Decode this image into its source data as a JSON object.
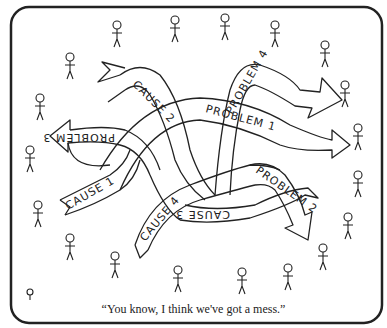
{
  "cartoon": {
    "caption": "“You know, I think we've got a mess.”",
    "arrows": [
      {
        "label": "CAUSE 2",
        "direction": "up-left"
      },
      {
        "label": "PROBLEM 4",
        "direction": "right"
      },
      {
        "label": "PROBLEM 1",
        "direction": "right"
      },
      {
        "label": "PROBLEM 3",
        "direction": "left"
      },
      {
        "label": "CAUSE 1",
        "direction": "left-tail"
      },
      {
        "label": "CAUSE 4",
        "direction": "down-tail"
      },
      {
        "label": "PROBLEM 2",
        "direction": "down-right"
      },
      {
        "label": "CAUSE 3",
        "direction": "right-tail"
      }
    ],
    "figures_count": 21,
    "colors": {
      "ink": "#222222",
      "paper": "#ffffff"
    }
  }
}
